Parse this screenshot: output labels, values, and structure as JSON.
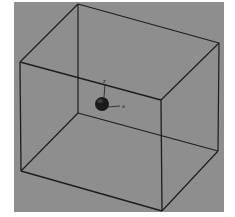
{
  "figure": {
    "background_color": "#8e8e8e",
    "frame_color": "#ffffff",
    "line_color": "#1e1e1e",
    "sphere_color": "#1a1a1a",
    "plot_area": {
      "x": 14,
      "y": 2,
      "width": 210,
      "height": 210
    }
  },
  "box": {
    "vertices": {
      "back_top_left": [
        78,
        4
      ],
      "back_top_right": [
        219,
        43
      ],
      "back_bottom_left": [
        78,
        113
      ],
      "back_bottom_right": [
        218,
        151
      ],
      "front_top_left": [
        20,
        62
      ],
      "front_top_right": [
        161,
        100
      ],
      "front_bottom_left": [
        21,
        171
      ],
      "front_bottom_right": [
        162,
        211
      ]
    }
  },
  "object": {
    "type": "sphere",
    "center": [
      102,
      104
    ],
    "radius": 7
  },
  "axes": {
    "z_label": "z",
    "x_label": "x",
    "y_label": "y"
  }
}
